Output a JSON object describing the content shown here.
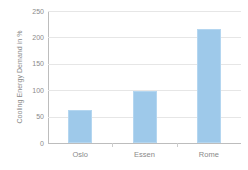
{
  "chart_data": {
    "type": "bar",
    "title": "",
    "xlabel": "",
    "ylabel": "Cooling Energy Demand in %",
    "categories": [
      "Oslo",
      "Essen",
      "Rome"
    ],
    "values": [
      62,
      98,
      215
    ],
    "series": [
      {
        "name": "Cooling Energy Demand",
        "values": [
          62,
          98,
          215
        ]
      }
    ],
    "ylim": [
      0,
      250
    ],
    "yticks": [
      0,
      50,
      100,
      150,
      200,
      250
    ],
    "ytick_labels": [
      "0",
      "50",
      "100",
      "150",
      "200",
      "250"
    ],
    "grid": true,
    "legend": false,
    "bar_color": "#9ec9ea",
    "bar_edge_color": "#b4d6f0",
    "grid_color": "#e6e6e6",
    "axis_color": "#bdbdbd",
    "text_color": "#8a8a8a",
    "background_color": "#ffffff"
  }
}
